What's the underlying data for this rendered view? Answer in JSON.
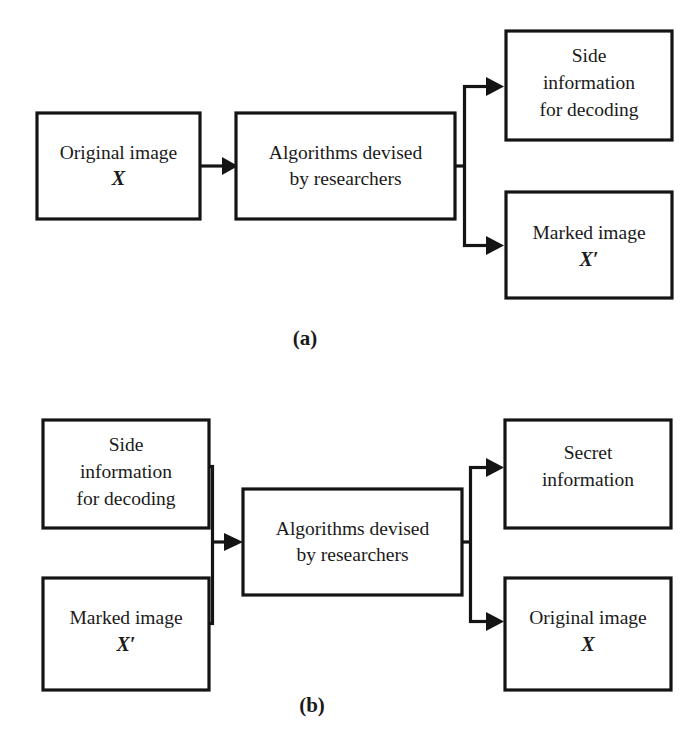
{
  "figure": {
    "background_color": "#ffffff",
    "line_color": "#141414",
    "panels": [
      {
        "id": "panel-a",
        "label": "(a)",
        "label_x": 305,
        "label_y": 340,
        "boxes": [
          {
            "name": "original-image-box",
            "x": 37,
            "y": 113,
            "w": 163,
            "h": 106,
            "lines": [
              {
                "text": "Original image",
                "variable": false
              },
              {
                "text": "X",
                "variable": true
              }
            ]
          },
          {
            "name": "algorithms-box",
            "x": 236,
            "y": 113,
            "w": 219,
            "h": 106,
            "lines": [
              {
                "text": "Algorithms devised",
                "variable": false
              },
              {
                "text": "by researchers",
                "variable": false
              }
            ]
          },
          {
            "name": "side-information-box",
            "x": 506,
            "y": 31,
            "w": 166,
            "h": 109,
            "lines": [
              {
                "text": "Side",
                "variable": false
              },
              {
                "text": "information",
                "variable": false
              },
              {
                "text": "for decoding",
                "variable": false
              }
            ]
          },
          {
            "name": "marked-image-box",
            "x": 506,
            "y": 192,
            "w": 166,
            "h": 106,
            "lines": [
              {
                "text": "Marked image",
                "variable": false
              },
              {
                "text": "X′",
                "variable": true
              }
            ]
          }
        ]
      },
      {
        "id": "panel-b",
        "label": "(b)",
        "label_x": 312,
        "label_y": 707,
        "boxes": [
          {
            "name": "side-information-box",
            "x": 43,
            "y": 420,
            "w": 166,
            "h": 108,
            "lines": [
              {
                "text": "Side",
                "variable": false
              },
              {
                "text": "information",
                "variable": false
              },
              {
                "text": "for decoding",
                "variable": false
              }
            ]
          },
          {
            "name": "marked-image-box",
            "x": 43,
            "y": 578,
            "w": 166,
            "h": 112,
            "lines": [
              {
                "text": "Marked image",
                "variable": false
              },
              {
                "text": "X′",
                "variable": true
              }
            ]
          },
          {
            "name": "algorithms-box",
            "x": 243,
            "y": 489,
            "w": 219,
            "h": 106,
            "lines": [
              {
                "text": "Algorithms devised",
                "variable": false
              },
              {
                "text": "by researchers",
                "variable": false
              }
            ]
          },
          {
            "name": "secret-information-box",
            "x": 505,
            "y": 420,
            "w": 166,
            "h": 108,
            "lines": [
              {
                "text": "Secret",
                "variable": false
              },
              {
                "text": "information",
                "variable": false
              }
            ]
          },
          {
            "name": "original-image-box",
            "x": 505,
            "y": 578,
            "w": 166,
            "h": 112,
            "lines": [
              {
                "text": "Original image",
                "variable": false
              },
              {
                "text": "X",
                "variable": true
              }
            ]
          }
        ]
      }
    ],
    "flow_description": {
      "panel_a": "Original image X feeds into Algorithms devised by researchers, which splits into Side information for decoding and Marked image X'.",
      "panel_b": "Side information for decoding and Marked image X' merge into Algorithms devised by researchers, which splits into Secret information and Original image X."
    }
  }
}
